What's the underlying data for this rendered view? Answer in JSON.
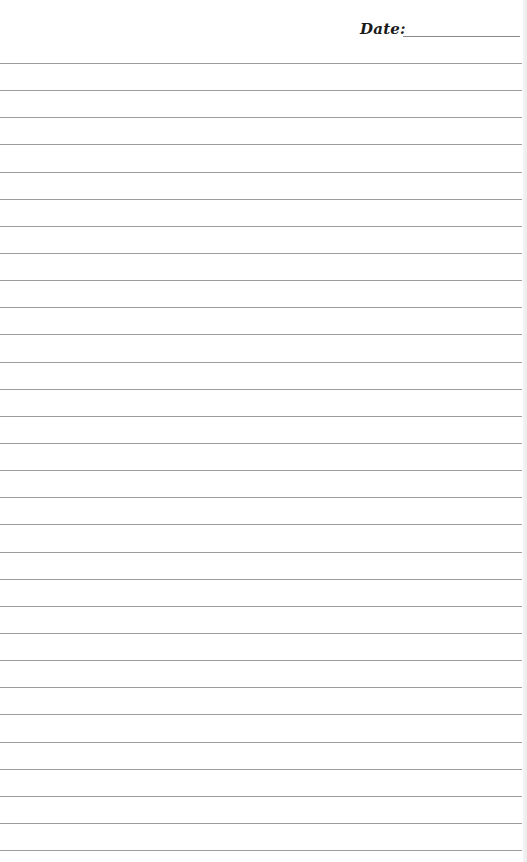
{
  "header": {
    "date_label": "Date:",
    "date_value": ""
  },
  "paper": {
    "type": "lined-notepaper",
    "line_count": 30,
    "first_line_y": 63,
    "line_spacing": 27.14,
    "line_color": "#9c9c9c",
    "background_color": "#ffffff"
  }
}
